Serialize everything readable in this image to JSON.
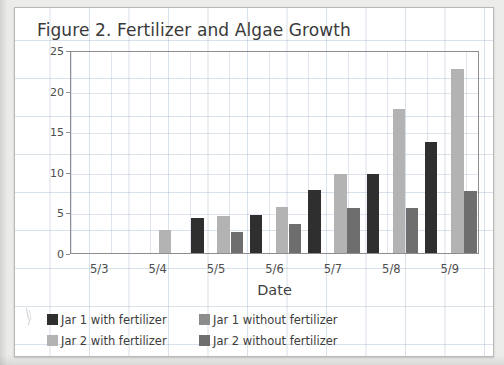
{
  "chart_data": {
    "type": "bar",
    "title": "Figure 2. Fertilizer and Algae Growth",
    "xlabel": "Date",
    "ylabel": "Diameter of algae (mm)",
    "categories": [
      "5/3",
      "5/4",
      "5/5",
      "5/6",
      "5/7",
      "5/8",
      "5/9"
    ],
    "ylim": [
      0,
      25
    ],
    "yticks": [
      0,
      5,
      10,
      15,
      20,
      25
    ],
    "ytick_labels": [
      "0",
      "5",
      "10",
      "15",
      "20",
      "25"
    ],
    "grid": true,
    "legend_position": "bottom-left",
    "series": [
      {
        "name": "Jar 1 with fertilizer",
        "color": "#2f2f2f",
        "values": [
          0,
          0,
          4.3,
          4.7,
          7.8,
          9.7,
          13.7
        ]
      },
      {
        "name": "Jar 1 without fertilizer",
        "color": "#8c8c8c",
        "values": [
          0,
          0,
          0,
          0,
          0,
          0,
          0
        ]
      },
      {
        "name": "Jar 2 with fertilizer",
        "color": "#b3b3b3",
        "values": [
          0,
          2.9,
          4.6,
          5.7,
          9.7,
          17.7,
          22.7
        ]
      },
      {
        "name": "Jar 2 without fertilizer",
        "color": "#6e6e6e",
        "values": [
          0,
          0,
          2.6,
          3.6,
          5.6,
          5.6,
          7.6
        ]
      }
    ]
  },
  "legend": {
    "entries": [
      {
        "label": "Jar 1 with fertilizer",
        "color": "#2f2f2f"
      },
      {
        "label": "Jar 1 without fertilizer",
        "color": "#8c8c8c"
      },
      {
        "label": "Jar 2 with fertilizer",
        "color": "#b3b3b3"
      },
      {
        "label": "Jar 2 without fertilizer",
        "color": "#6e6e6e"
      }
    ]
  }
}
